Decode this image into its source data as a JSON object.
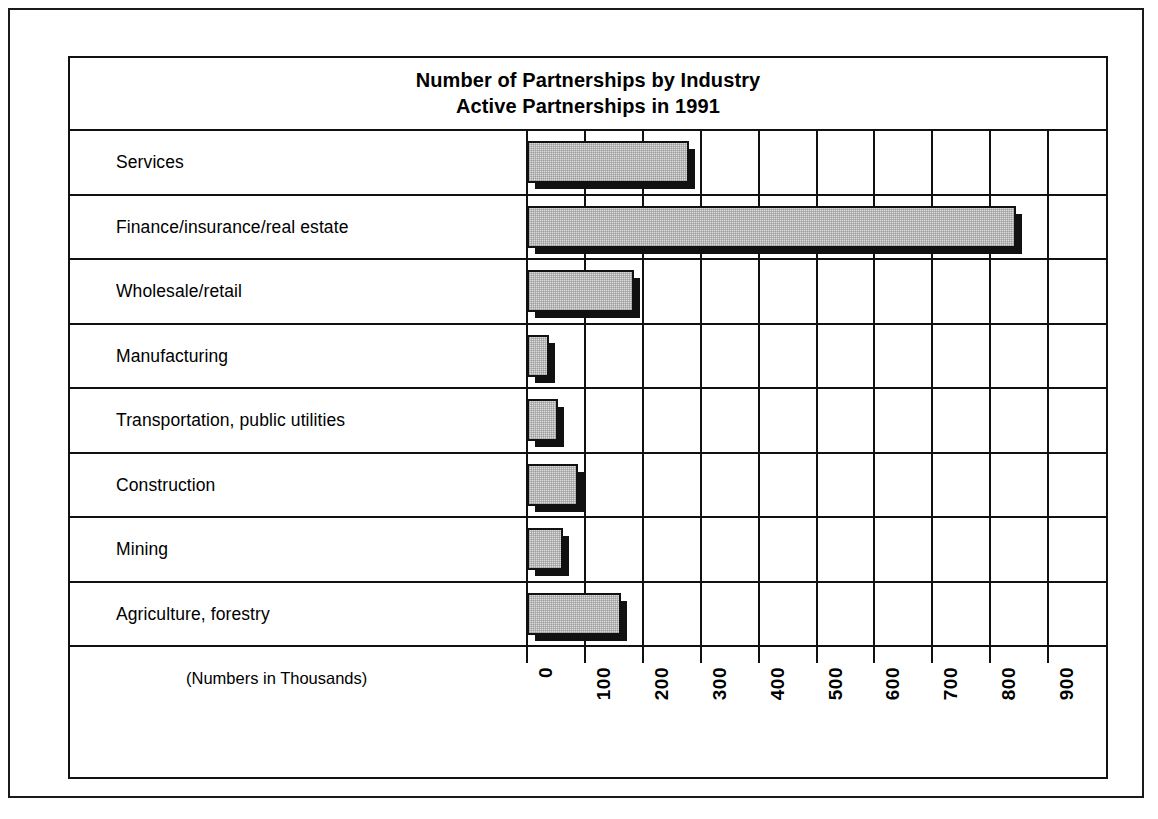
{
  "chart_data": {
    "type": "bar",
    "orientation": "horizontal",
    "title": "Number of Partnerships by Industry",
    "subtitle": "Active Partnerships in 1991",
    "xlabel": "(Numbers in Thousands)",
    "ylabel": "",
    "xlim": [
      0,
      900
    ],
    "xticks": [
      "0",
      "100",
      "200",
      "300",
      "400",
      "500",
      "600",
      "700",
      "800",
      "900"
    ],
    "grid": true,
    "legend": "none",
    "categories": [
      "Services",
      "Finance/insurance/real estate",
      "Wholesale/retail",
      "Manufacturing",
      "Transportation, public utilities",
      "Construction",
      "Mining",
      "Agriculture, forestry"
    ],
    "values": [
      280,
      845,
      185,
      38,
      54,
      88,
      63,
      163
    ],
    "units": "thousands"
  },
  "chart": {
    "title_line1": "Number of Partnerships by Industry",
    "title_line2": "Active Partnerships in 1991",
    "axis_units_label": "(Numbers in Thousands)",
    "bar_fill_color": "#dcdcdc",
    "line_color": "#111111",
    "background_color": "#ffffff"
  }
}
